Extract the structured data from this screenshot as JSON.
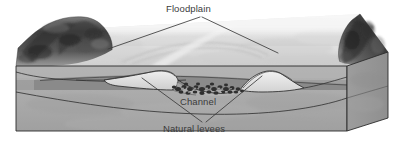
{
  "figure": {
    "title_alt": "Floodplain block diagram",
    "type": "geologic block diagram",
    "width": 401,
    "height": 142
  },
  "labels": {
    "floodplain": "Floodplain",
    "channel": "Channel",
    "natural_levees": "Natural levees"
  },
  "colors": {
    "background": "#ffffff",
    "floodplain_surface_light": "#ededed",
    "floodplain_surface_mid": "#dcdcdc",
    "block_front_face": "#a9a9a9",
    "block_side_face": "#9a9a9a",
    "subsurface_dark_band": "#8a8a8a",
    "subsurface_mid_band": "#9f9f9f",
    "valley_wall_dark": "#4a4a4a",
    "valley_wall_shadow": "#2e2e2e",
    "channel_gravel": "#3a3a3a",
    "outline": "#2b2b2b",
    "label_text": "#3b3b3b",
    "leader_line": "#3b3b3b"
  },
  "features": [
    {
      "name": "floodplain",
      "label": "Floodplain",
      "description": "broad flat valley-floor surface"
    },
    {
      "name": "channel",
      "label": "Channel",
      "description": "river channel with coarse gravel bed load"
    },
    {
      "name": "natural-levees",
      "label": "Natural levees",
      "description": "raised ridges flanking the channel"
    },
    {
      "name": "valley-wall-left",
      "label": "",
      "description": "dark eroded bluff at left margin"
    },
    {
      "name": "valley-wall-right",
      "label": "",
      "description": "dark eroded bluff at right margin"
    }
  ]
}
